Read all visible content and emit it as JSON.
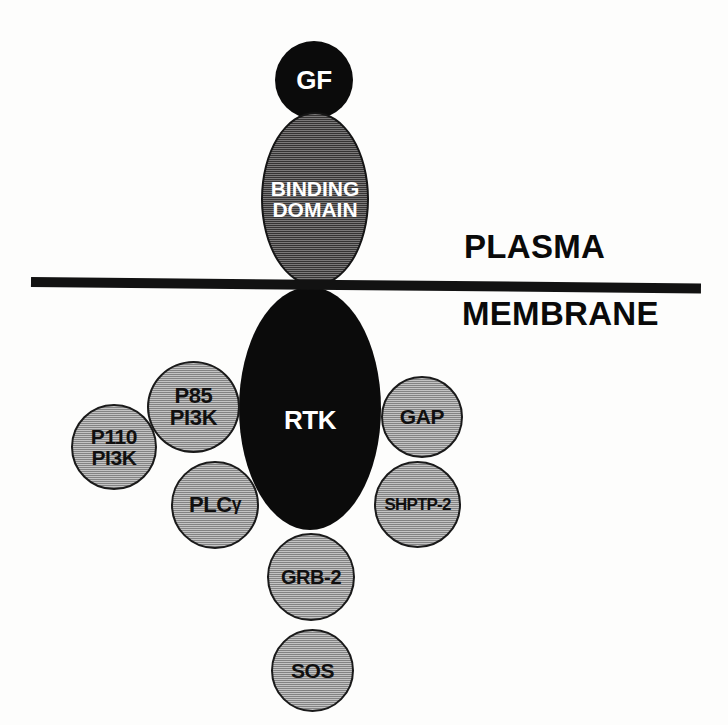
{
  "diagram": {
    "background_color": "#ffffff"
  },
  "membrane": {
    "upper_label": "PLASMA",
    "lower_label": "MEMBRANE",
    "line_color": "#121212"
  },
  "nodes": {
    "growth_factor": {
      "label": "GF",
      "shape": "circle",
      "fill": "#0b0b0b",
      "text_color": "#ffffff"
    },
    "binding_domain": {
      "line1": "BINDING",
      "line2": "DOMAIN",
      "shape": "ellipse",
      "fill": "#4d4b4b",
      "text_color": "#ffffff"
    },
    "rtk": {
      "label": "RTK",
      "shape": "ellipse",
      "fill": "#0b0b0b",
      "text_color": "#ffffff"
    },
    "p110_pi3k": {
      "line1": "P110",
      "line2": "PI3K",
      "shape": "circle",
      "fill": "#9c9c9c",
      "text_color": "#100f0f"
    },
    "p85_pi3k": {
      "line1": "P85",
      "line2": "PI3K",
      "shape": "circle",
      "fill": "#9c9c9c",
      "text_color": "#100f0f"
    },
    "plc_gamma": {
      "label": "PLC",
      "greek": "γ",
      "shape": "circle",
      "fill": "#9c9c9c",
      "text_color": "#100f0f"
    },
    "gap": {
      "label": "GAP",
      "shape": "circle",
      "fill": "#9c9c9c",
      "text_color": "#100f0f"
    },
    "shptp2": {
      "label": "SHPTP-2",
      "shape": "circle",
      "fill": "#9c9c9c",
      "text_color": "#100f0f"
    },
    "grb2": {
      "label": "GRB-2",
      "shape": "circle",
      "fill": "#9c9c9c",
      "text_color": "#100f0f"
    },
    "sos": {
      "label": "SOS",
      "shape": "circle",
      "fill": "#9c9c9c",
      "text_color": "#100f0f"
    }
  }
}
